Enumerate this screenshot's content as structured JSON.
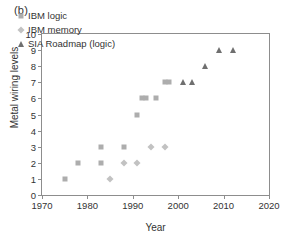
{
  "panel": {
    "label": "(b)"
  },
  "chart_data": {
    "type": "scatter",
    "title": "",
    "xlabel": "Year",
    "ylabel": "Metal wiring levels",
    "xlim": [
      1970,
      2020
    ],
    "ylim": [
      0,
      10
    ],
    "xticks": [
      1970,
      1980,
      1990,
      2000,
      2010,
      2020
    ],
    "yticks": [
      0,
      1,
      2,
      3,
      4,
      5,
      6,
      7,
      8,
      9,
      10
    ],
    "grid": false,
    "legend_position": "upper-left",
    "series": [
      {
        "name": "IBM logic",
        "marker": "square",
        "color": "#adadad",
        "points": [
          {
            "x": 1975,
            "y": 1
          },
          {
            "x": 1978,
            "y": 2
          },
          {
            "x": 1983,
            "y": 2
          },
          {
            "x": 1983,
            "y": 3
          },
          {
            "x": 1988,
            "y": 3
          },
          {
            "x": 1991,
            "y": 5
          },
          {
            "x": 1992,
            "y": 6
          },
          {
            "x": 1993,
            "y": 6
          },
          {
            "x": 1995,
            "y": 6
          },
          {
            "x": 1997,
            "y": 7
          },
          {
            "x": 1998,
            "y": 7
          }
        ]
      },
      {
        "name": "IBM memory",
        "marker": "diamond",
        "color": "#c2c2c2",
        "points": [
          {
            "x": 1985,
            "y": 1
          },
          {
            "x": 1988,
            "y": 2
          },
          {
            "x": 1991,
            "y": 2
          },
          {
            "x": 1994,
            "y": 3
          },
          {
            "x": 1997,
            "y": 3
          }
        ]
      },
      {
        "name": "SIA Roadmap (logic)",
        "marker": "triangle",
        "color": "#6f6f6f",
        "points": [
          {
            "x": 2001,
            "y": 7
          },
          {
            "x": 2003,
            "y": 7
          },
          {
            "x": 2006,
            "y": 8
          },
          {
            "x": 2009,
            "y": 9
          },
          {
            "x": 2012,
            "y": 9
          }
        ]
      }
    ]
  }
}
